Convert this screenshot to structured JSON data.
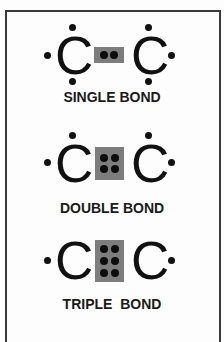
{
  "colors": {
    "border": "#3a3a3a",
    "shared_pair_box": "#7d7d7d",
    "electron": "#111111",
    "background": "#fdfdfd"
  },
  "bonds": [
    {
      "label": "SINGLE BOND",
      "left_atom": "C",
      "right_atom": "C",
      "shared_electrons": 2,
      "lone_electrons_per_atom": 3
    },
    {
      "label": "DOUBLE BOND",
      "left_atom": "C",
      "right_atom": "C",
      "shared_electrons": 4,
      "lone_electrons_per_atom": 2
    },
    {
      "label": "TRIPLE  BOND",
      "left_atom": "C",
      "right_atom": "C",
      "shared_electrons": 6,
      "lone_electrons_per_atom": 1
    }
  ]
}
